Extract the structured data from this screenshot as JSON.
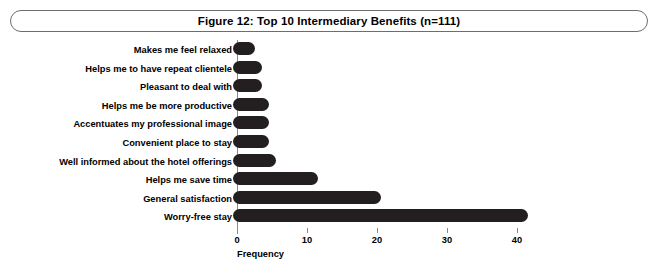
{
  "figure": {
    "title": "Figure 12: Top 10 Intermediary Benefits (n=111)"
  },
  "chart_data": {
    "type": "bar",
    "orientation": "horizontal",
    "title": "Figure 12: Top 10 Intermediary Benefits (n=111)",
    "xlabel": "Frequency",
    "ylabel": "",
    "xlim": [
      0,
      43
    ],
    "xticks": [
      0,
      10,
      20,
      30,
      40
    ],
    "xtick_labels": [
      "0",
      "10",
      "20",
      "30",
      "40"
    ],
    "grid": false,
    "legend": false,
    "bar_color": "#231f20",
    "axis_color": "#8a8a8a",
    "sample_size": 111,
    "categories": [
      "Makes me feel relaxed",
      "Helps me to have repeat clientele",
      "Pleasant to deal with",
      "Helps me be more productive",
      "Accentuates my professional image",
      "Convenient place to stay",
      "Well informed about the hotel offerings",
      "Helps me save time",
      "General satisfaction",
      "Worry-free stay"
    ],
    "values": [
      2,
      3,
      3,
      4,
      4,
      4,
      5,
      11,
      20,
      41
    ]
  }
}
